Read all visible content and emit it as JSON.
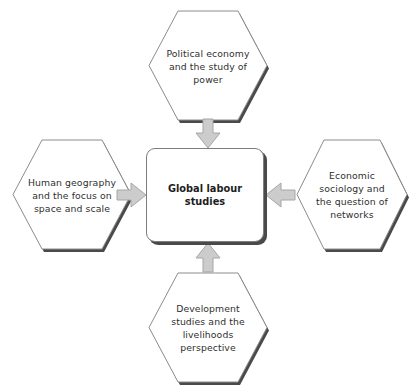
{
  "diagram": {
    "background_color": "#ffffff",
    "center": {
      "label": "Global labour\nstudies",
      "shape": "rounded-rectangle",
      "fill": "#ffffff",
      "border_color": "#7d7d7d",
      "text_color": "#1d1d1d"
    },
    "nodes": [
      {
        "id": "political-economy",
        "position": "top",
        "shape": "hexagon",
        "label": "Political economy\nand the study of\npower",
        "fill": "#ffffff",
        "border_color": "#8c8c8c"
      },
      {
        "id": "human-geography",
        "position": "left",
        "shape": "hexagon",
        "label": "Human geography\nand the focus on\nspace and scale",
        "fill": "#ffffff",
        "border_color": "#8c8c8c"
      },
      {
        "id": "economic-sociology",
        "position": "right",
        "shape": "hexagon",
        "label": "Economic\nsociology and\nthe question of\nnetworks",
        "fill": "#ffffff",
        "border_color": "#8c8c8c"
      },
      {
        "id": "development-studies",
        "position": "bottom",
        "shape": "hexagon",
        "label": "Development\nstudies and the\nlivelihoods\nperspective",
        "fill": "#ffffff",
        "border_color": "#8c8c8c"
      }
    ],
    "arrows": [
      {
        "id": "arrow-top",
        "from": "political-economy",
        "to": "center",
        "direction": "down",
        "fill": "#cccccc",
        "border_color": "#a6a6a6"
      },
      {
        "id": "arrow-left",
        "from": "human-geography",
        "to": "center",
        "direction": "right",
        "fill": "#cccccc",
        "border_color": "#a6a6a6"
      },
      {
        "id": "arrow-right",
        "from": "economic-sociology",
        "to": "center",
        "direction": "left",
        "fill": "#cccccc",
        "border_color": "#a6a6a6"
      },
      {
        "id": "arrow-bottom",
        "from": "development-studies",
        "to": "center",
        "direction": "up",
        "fill": "#cccccc",
        "border_color": "#a6a6a6"
      }
    ]
  }
}
